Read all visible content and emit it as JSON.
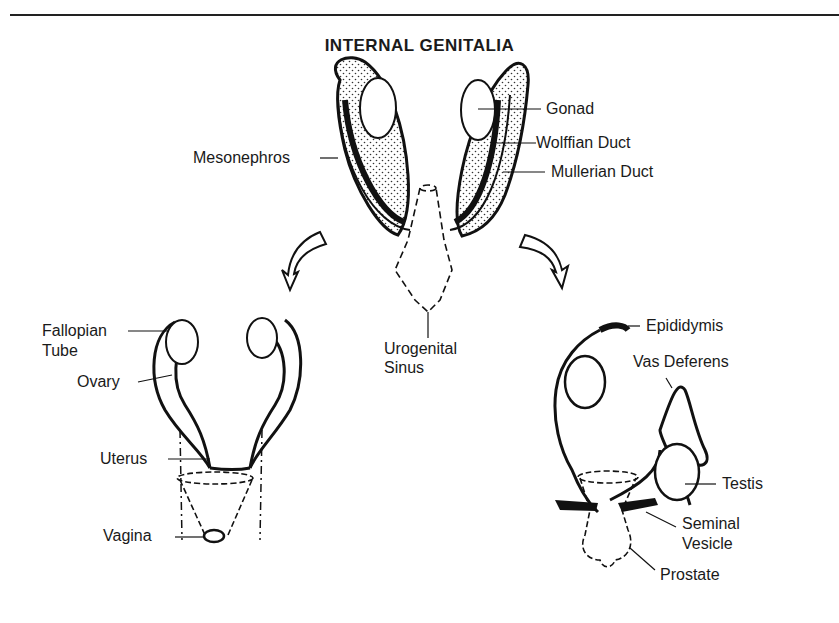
{
  "title": "INTERNAL GENITALIA",
  "labels": {
    "gonad": "Gonad",
    "wolffian_duct": "Wolffian Duct",
    "mullerian_duct": "Mullerian Duct",
    "mesonephros": "Mesonephros",
    "urogenital_sinus_1": "Urogenital",
    "urogenital_sinus_2": "Sinus",
    "fallopian_tube_1": "Fallopian",
    "fallopian_tube_2": "Tube",
    "ovary": "Ovary",
    "uterus": "Uterus",
    "vagina": "Vagina",
    "epididymis": "Epididymis",
    "vas_deferens": "Vas Deferens",
    "testis": "Testis",
    "seminal_vesicle_1": "Seminal",
    "seminal_vesicle_2": "Vesicle",
    "prostate": "Prostate"
  }
}
